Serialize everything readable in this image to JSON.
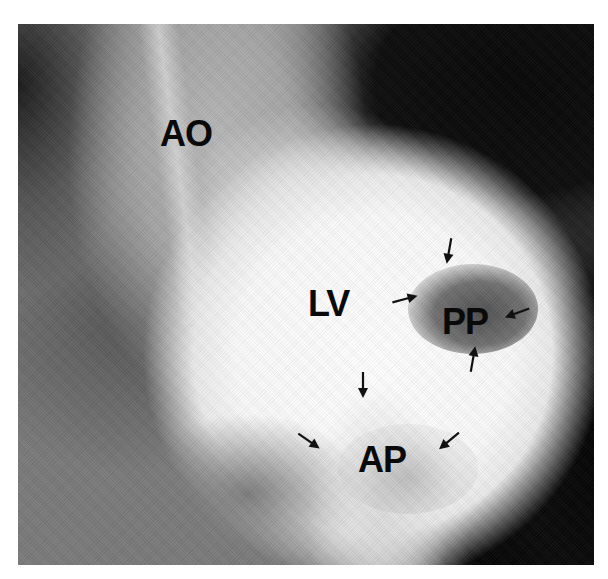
{
  "image": {
    "type": "grayscale left ventriculogram (angiogram)",
    "background": "#ffffff",
    "frame": {
      "left": 18,
      "top": 24,
      "width": 576,
      "height": 541
    }
  },
  "labels": {
    "aorta": "AO",
    "left_ventricle": "LV",
    "posterior_papillary": "PP",
    "anterior_papillary": "AP"
  },
  "arrows": [
    {
      "id": "pp-top",
      "x": 436,
      "y": 238,
      "angle": 100
    },
    {
      "id": "pp-left",
      "x": 392,
      "y": 286,
      "angle": -15
    },
    {
      "id": "pp-right",
      "x": 504,
      "y": 300,
      "angle": 160
    },
    {
      "id": "pp-bottom",
      "x": 460,
      "y": 346,
      "angle": -80
    },
    {
      "id": "ap-top",
      "x": 350,
      "y": 372,
      "angle": 90
    },
    {
      "id": "ap-left",
      "x": 296,
      "y": 428,
      "angle": 35
    },
    {
      "id": "ap-right",
      "x": 436,
      "y": 428,
      "angle": 140
    }
  ]
}
